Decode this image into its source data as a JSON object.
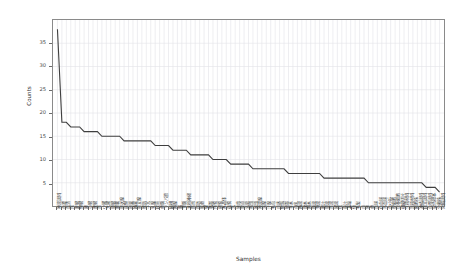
{
  "chart_data": {
    "type": "line",
    "title": "",
    "xlabel": "Samples",
    "ylabel": "Counts",
    "ylim": [
      0,
      40
    ],
    "xlim": [
      0,
      86
    ],
    "grid": true,
    "legend": null,
    "y_ticks": [
      5,
      10,
      15,
      20,
      25,
      30,
      35
    ],
    "series": [
      {
        "name": "Counts",
        "color": "#3f3f3f",
        "values": [
          38,
          18,
          18,
          17,
          17,
          17,
          16,
          16,
          16,
          16,
          15,
          15,
          15,
          15,
          15,
          14,
          14,
          14,
          14,
          14,
          14,
          14,
          13,
          13,
          13,
          13,
          12,
          12,
          12,
          12,
          11,
          11,
          11,
          11,
          11,
          10,
          10,
          10,
          10,
          9,
          9,
          9,
          9,
          9,
          8,
          8,
          8,
          8,
          8,
          8,
          8,
          8,
          7,
          7,
          7,
          7,
          7,
          7,
          7,
          7,
          6,
          6,
          6,
          6,
          6,
          6,
          6,
          6,
          6,
          6,
          5,
          5,
          5,
          5,
          5,
          5,
          5,
          5,
          5,
          5,
          5,
          5,
          5,
          4,
          4,
          4,
          3
        ]
      }
    ],
    "categories": [
      "唾液試料",
      "血漿",
      "血清",
      "尿",
      "肝臓",
      "腎臓",
      "肺",
      "心臓",
      "脾臓",
      "胃",
      "小腸",
      "大腸",
      "膵臓",
      "胆嚢",
      "甲状腺",
      "副腎",
      "卵巣",
      "精巣",
      "前立腺",
      "膀胱",
      "子宮",
      "乳腺",
      "皮膚",
      "骨髄",
      "リンパ節",
      "扁桃",
      "胸腺",
      "脳",
      "脊髄",
      "末梢神経",
      "筋肉",
      "脂肪",
      "軟骨",
      "腱",
      "靱帯",
      "角膜",
      "網膜",
      "水晶体",
      "鼓膜",
      "舌",
      "歯肉",
      "食道",
      "気管",
      "咽頭",
      "喉頭",
      "唾液腺",
      "涙腺",
      "汗腺",
      "毛包",
      "爪床",
      "胎盤",
      "臍帯",
      "羊水",
      "母乳",
      "精液",
      "腹水",
      "胸水",
      "髄液",
      "滑液",
      "胆汁",
      "膵液",
      "胃液",
      "腸液",
      "痰",
      "鼻汁",
      "耳垢",
      "便",
      "毛髪",
      "爪",
      "歯",
      "骨",
      "血球",
      "白血球",
      "赤血球",
      "血小板",
      "幹細胞",
      "培養細胞",
      "組織切片",
      "生検材料",
      "剖検材料",
      "細胞株",
      "凍結試料",
      "固定試料",
      "包埋試料",
      "染色標本",
      "分離株",
      "対照試料"
    ]
  }
}
